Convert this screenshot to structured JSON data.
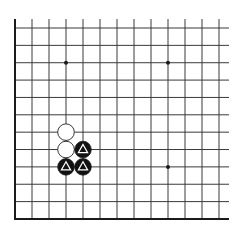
{
  "board": {
    "description": "Go board corner diagram (lower-left corner)",
    "columns": 13,
    "rows": 12,
    "origin_x": 15,
    "origin_y": 28,
    "spacing_x": 17,
    "spacing_y": 17.36,
    "line_extend_top": 9,
    "line_extend_right": 10,
    "edges": {
      "left": true,
      "bottom": true,
      "top": false,
      "right": false
    },
    "colors": {
      "background": "#ffffff",
      "line": "#3a3a3a",
      "edge": "#1a1a1a",
      "black_stone": "#111111",
      "white_stone": "#ffffff",
      "stone_outline": "#222222",
      "marker_on_black": "#ffffff"
    },
    "stone_radius": 8.3,
    "star_points": [
      {
        "col": 3,
        "row": 2
      },
      {
        "col": 9,
        "row": 2
      },
      {
        "col": 9,
        "row": 8
      }
    ],
    "stones": [
      {
        "color": "white",
        "col": 3,
        "row": 6,
        "marker": "none"
      },
      {
        "color": "white",
        "col": 3,
        "row": 7,
        "marker": "none"
      },
      {
        "color": "black",
        "col": 4,
        "row": 7,
        "marker": "triangle"
      },
      {
        "color": "black",
        "col": 3,
        "row": 8,
        "marker": "triangle"
      },
      {
        "color": "black",
        "col": 4,
        "row": 8,
        "marker": "triangle"
      }
    ]
  }
}
